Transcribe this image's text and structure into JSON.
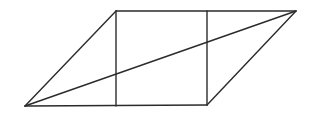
{
  "diagram": {
    "type": "geometry",
    "stroke_color": "#2b2b2b",
    "vertices": {
      "bottom_left": [
        25,
        106
      ],
      "top_left": [
        116,
        11
      ],
      "top_right": [
        296,
        11
      ],
      "bottom_right": [
        207,
        105
      ]
    },
    "segments": [
      {
        "id": "top-edge",
        "from": [
          116,
          11
        ],
        "to": [
          296,
          11
        ]
      },
      {
        "id": "bottom-edge",
        "from": [
          25,
          106
        ],
        "to": [
          207,
          105
        ]
      },
      {
        "id": "left-edge",
        "from": [
          25,
          106
        ],
        "to": [
          116,
          11
        ]
      },
      {
        "id": "right-edge",
        "from": [
          207,
          105
        ],
        "to": [
          296,
          11
        ]
      },
      {
        "id": "left-vertical",
        "from": [
          116,
          11
        ],
        "to": [
          116,
          106
        ]
      },
      {
        "id": "right-vertical",
        "from": [
          207,
          11
        ],
        "to": [
          207,
          105
        ]
      },
      {
        "id": "diagonal",
        "from": [
          25,
          106
        ],
        "to": [
          296,
          11
        ]
      }
    ],
    "labels": []
  }
}
